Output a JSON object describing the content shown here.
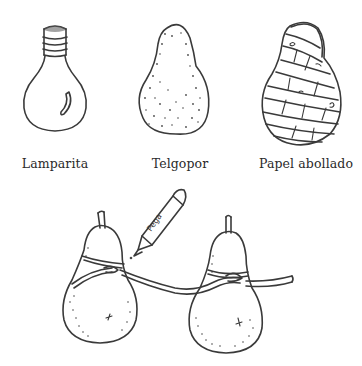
{
  "figure": {
    "items": [
      {
        "id": "lamparita",
        "label": "Lamparita",
        "icon": "light-bulb-icon",
        "caption_x": 55
      },
      {
        "id": "telgopor",
        "label": "Telgopor",
        "icon": "styrofoam-pear-icon",
        "caption_x": 180
      },
      {
        "id": "papel",
        "label": "Papel abollado",
        "icon": "crumpled-paper-pear-icon",
        "caption_x": 306
      }
    ],
    "bottom_scene": {
      "description": "Two pears tied together with string, glue pen",
      "pen_label": "Pega",
      "icons": [
        "pear-left-icon",
        "pear-right-icon",
        "glue-pen-icon",
        "string-icon"
      ]
    }
  },
  "colors": {
    "ink": "#3a3a3a",
    "background": "#ffffff"
  }
}
